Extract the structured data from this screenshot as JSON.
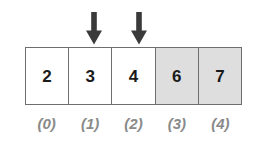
{
  "diagram": {
    "name": "array-with-index-pointers",
    "type": "array-cells",
    "background_color": "#ffffff",
    "border_color": "#6e6e6e",
    "shade_color": "#dedede",
    "value_color": "#1a1a1a",
    "index_color": "#8a8a8a",
    "arrow_color": "#3a3a3a",
    "cells": [
      {
        "value": "2",
        "index_label": "(0)",
        "shaded": false,
        "pointer": false
      },
      {
        "value": "3",
        "index_label": "(1)",
        "shaded": false,
        "pointer": true
      },
      {
        "value": "4",
        "index_label": "(2)",
        "shaded": false,
        "pointer": true
      },
      {
        "value": "6",
        "index_label": "(3)",
        "shaded": true,
        "pointer": false
      },
      {
        "value": "7",
        "index_label": "(4)",
        "shaded": true,
        "pointer": false
      }
    ],
    "pointers": [
      {
        "name": "pointer-arrow-1",
        "target_index_label": "(1)",
        "glyph": "down-arrow-icon",
        "left_pct": 32.0
      },
      {
        "name": "pointer-arrow-2",
        "target_index_label": "(2)",
        "glyph": "down-arrow-icon",
        "left_pct": 52.5
      }
    ]
  }
}
